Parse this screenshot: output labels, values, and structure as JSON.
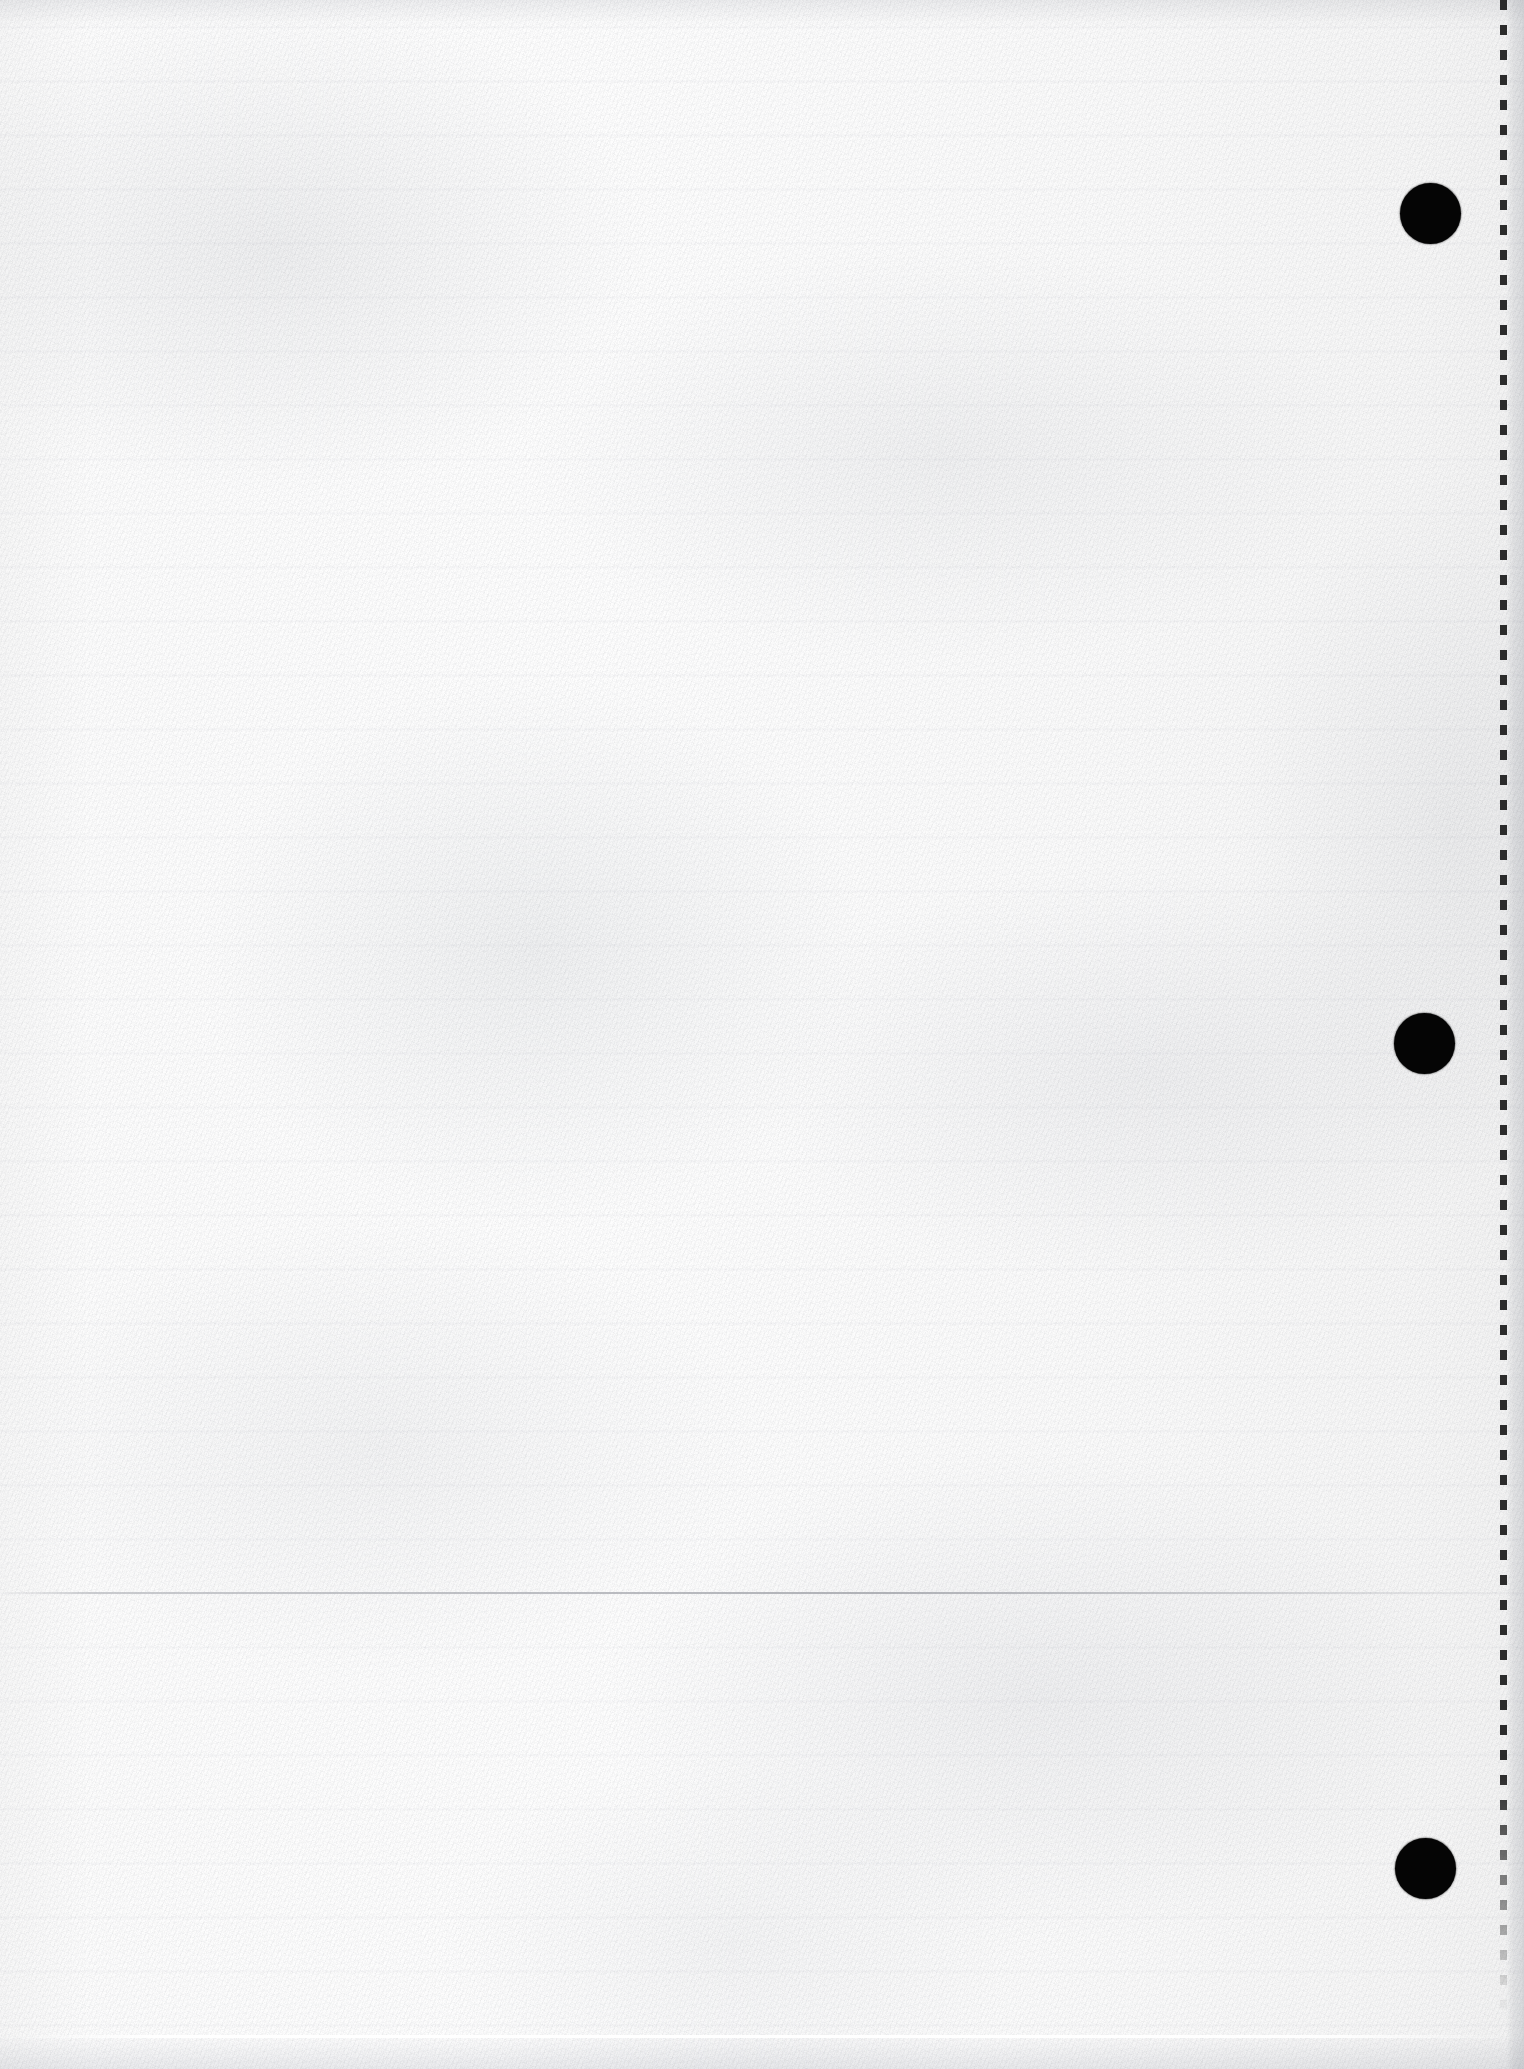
{
  "document": {
    "kind": "scanned-page",
    "content_text": "",
    "page_width": 1524,
    "page_height": 2069,
    "background_color": "#fbfbfb",
    "ink_color": "#050505"
  },
  "perforation": {
    "name": "vertical-dashed-perforation-line",
    "x": 1500,
    "width": 7,
    "top": 0,
    "bottom": 2015,
    "dash_length": 10,
    "dash_gap": 15,
    "color": "#1c1c1c"
  },
  "punch_holes": [
    {
      "label": "punch-hole-top",
      "cx": 1430,
      "cy": 213,
      "diameter": 61
    },
    {
      "label": "punch-hole-middle",
      "cx": 1424,
      "cy": 1043,
      "diameter": 61
    },
    {
      "label": "punch-hole-bottom",
      "cx": 1425,
      "cy": 1868,
      "diameter": 61
    }
  ],
  "seams": [
    {
      "label": "scan-seam-upper",
      "y": 1592,
      "type": "dark"
    },
    {
      "label": "scan-seam-lower",
      "y": 2035,
      "type": "light"
    }
  ],
  "margin_strip": {
    "label": "right-margin-strip",
    "x": 1506,
    "width": 18,
    "color": "#e5e6e9"
  }
}
